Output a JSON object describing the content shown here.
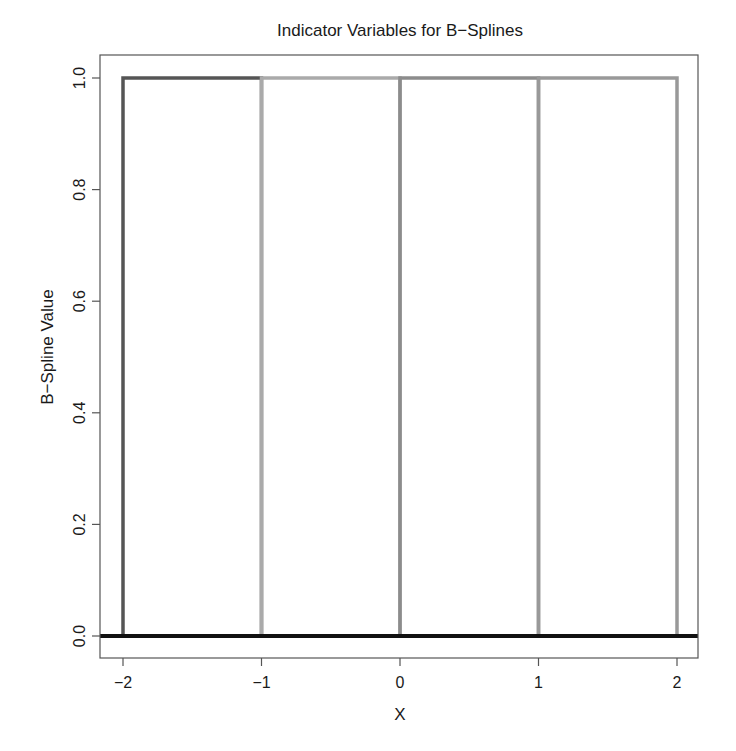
{
  "chart_data": {
    "type": "line",
    "title": "Indicator Variables for B−Splines",
    "xlabel": "X",
    "ylabel": "B−Spline Value",
    "xlim": [
      -2.16,
      2.16
    ],
    "ylim": [
      -0.04,
      1.04
    ],
    "x_ticks": [
      -2,
      -1,
      0,
      1,
      2
    ],
    "x_tick_labels": [
      "−2",
      "−1",
      "0",
      "1",
      "2"
    ],
    "y_ticks": [
      0.0,
      0.2,
      0.4,
      0.6,
      0.8,
      1.0
    ],
    "y_tick_labels": [
      "0.0",
      "0.2",
      "0.4",
      "0.6",
      "0.8",
      "1.0"
    ],
    "grid": false,
    "legend": null,
    "baseline": {
      "y": 0,
      "color": "#111111",
      "width": 4
    },
    "series": [
      {
        "name": "B1",
        "interval": [
          -2,
          -1
        ],
        "x": [
          -2,
          -2,
          -1,
          -1
        ],
        "y": [
          0,
          1,
          1,
          0
        ],
        "color": "#555555"
      },
      {
        "name": "B2",
        "interval": [
          -1,
          0
        ],
        "x": [
          -1,
          -1,
          0,
          0
        ],
        "y": [
          0,
          1,
          1,
          0
        ],
        "color": "#aaaaaa"
      },
      {
        "name": "B3",
        "interval": [
          0,
          1
        ],
        "x": [
          0,
          0,
          1,
          1
        ],
        "y": [
          0,
          1,
          1,
          0
        ],
        "color": "#8c8c8c"
      },
      {
        "name": "B4",
        "interval": [
          1,
          2
        ],
        "x": [
          1,
          1,
          2,
          2
        ],
        "y": [
          0,
          1,
          1,
          0
        ],
        "color": "#999999"
      }
    ]
  },
  "layout": {
    "plot_box": {
      "left": 100,
      "top": 55,
      "right": 698,
      "bottom": 658
    },
    "x_pixels": {
      "-2": 123,
      "2": 677
    },
    "y_pixels": {
      "0": 636,
      "1": 78
    }
  }
}
